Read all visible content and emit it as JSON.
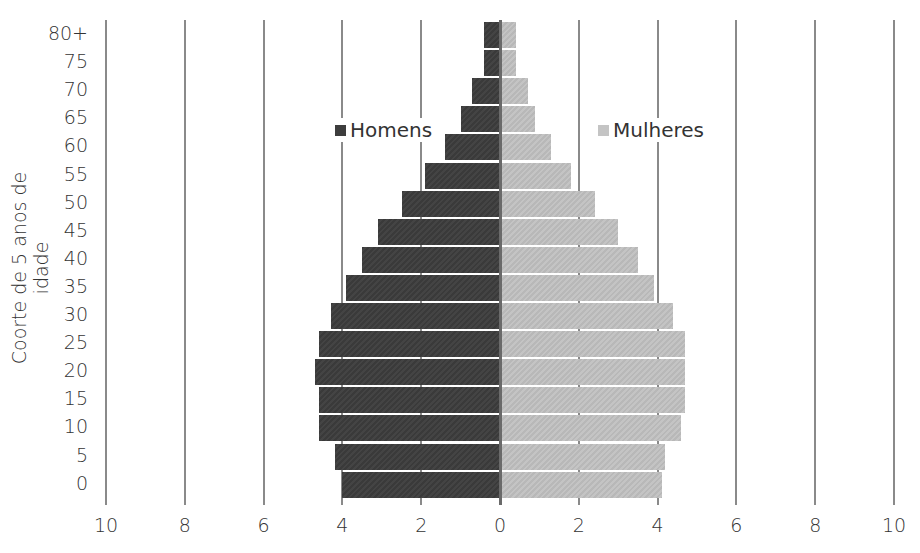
{
  "chart_data": {
    "type": "bar",
    "orientation": "horizontal",
    "subtype": "population-pyramid",
    "title": "",
    "ylabel": "Coorte de 5 anos de idade",
    "xlabel": "",
    "xlim": [
      -10,
      10
    ],
    "x_ticks": [
      "10",
      "8",
      "6",
      "4",
      "2",
      "0",
      "2",
      "4",
      "6",
      "8",
      "10"
    ],
    "grid": true,
    "legend_position": "inside-top",
    "categories": [
      "80+",
      "75",
      "70",
      "65",
      "60",
      "55",
      "50",
      "45",
      "40",
      "35",
      "30",
      "25",
      "20",
      "15",
      "10",
      "5",
      "0"
    ],
    "series": [
      {
        "name": "Homens",
        "color": "#3d3d3d",
        "side": "left",
        "values": [
          0.4,
          0.4,
          0.7,
          1.0,
          1.4,
          1.9,
          2.5,
          3.1,
          3.5,
          3.9,
          4.3,
          4.6,
          4.7,
          4.6,
          4.6,
          4.2,
          4.0
        ]
      },
      {
        "name": "Mulheres",
        "color": "#bdbdbd",
        "side": "right",
        "values": [
          0.4,
          0.4,
          0.7,
          0.9,
          1.3,
          1.8,
          2.4,
          3.0,
          3.5,
          3.9,
          4.4,
          4.7,
          4.7,
          4.7,
          4.6,
          4.2,
          4.1
        ]
      }
    ]
  },
  "legend": {
    "men": "Homens",
    "women": "Mulheres"
  },
  "axis": {
    "y_title": "Coorte de 5 anos de idade"
  }
}
